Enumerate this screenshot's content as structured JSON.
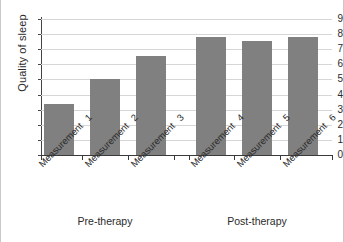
{
  "chart_data": {
    "type": "bar",
    "title": "",
    "subtitle": "",
    "xlabel": "",
    "ylabel": "Quality of sleep",
    "ylim": [
      0,
      9
    ],
    "ytick_labels": [
      "0",
      "1",
      "2",
      "3",
      "4",
      "5",
      "6",
      "7",
      "8",
      "9"
    ],
    "ytick_values": [
      0,
      1,
      2,
      3,
      4,
      5,
      6,
      7,
      8,
      9
    ],
    "grid": true,
    "legend": false,
    "categories": [
      "Measurement 1",
      "Measurement 2",
      "Measurement 3",
      "Measurement 4",
      "Measurement 5",
      "Measurement 6"
    ],
    "category_word": "Measurement",
    "category_numbers": [
      "1",
      "2",
      "3",
      "4",
      "5",
      "6"
    ],
    "values": [
      3.4,
      5.0,
      6.55,
      7.8,
      7.55,
      7.8
    ],
    "bar_color": "#808080",
    "grid_color": "#d6d6d6",
    "axis_color": "#3a3a3a",
    "groups": [
      {
        "label": "Pre-therapy",
        "members": [
          0,
          1,
          2
        ]
      },
      {
        "label": "Post-therapy",
        "members": [
          3,
          4,
          5
        ]
      }
    ]
  },
  "figure": {
    "background": "#ffffff",
    "border_color": "#c9c9c9"
  }
}
